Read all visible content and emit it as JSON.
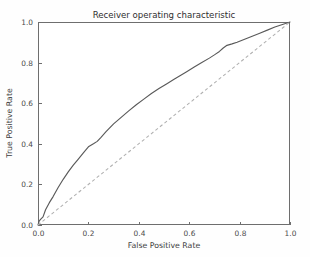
{
  "chart_data": {
    "type": "line",
    "title": "Receiver operating characteristic",
    "xlabel": "False Positive Rate",
    "ylabel": "True Positive Rate",
    "xlim": [
      0.0,
      1.0
    ],
    "ylim": [
      0.0,
      1.0
    ],
    "grid": false,
    "legend": "none",
    "xticks": [
      "0.0",
      "0.2",
      "0.4",
      "0.6",
      "0.8",
      "1.0"
    ],
    "xtick_values": [
      0.0,
      0.2,
      0.4,
      0.6,
      0.8,
      1.0
    ],
    "yticks": [
      "0.0",
      "0.2",
      "0.4",
      "0.6",
      "0.8",
      "1.0"
    ],
    "ytick_values": [
      0.0,
      0.2,
      0.4,
      0.6,
      0.8,
      1.0
    ],
    "series": [
      {
        "name": "ROC curve",
        "style": "solid",
        "color": "#5a5a5a",
        "x": [
          0.0,
          0.005,
          0.012,
          0.02,
          0.03,
          0.045,
          0.06,
          0.08,
          0.1,
          0.12,
          0.14,
          0.16,
          0.18,
          0.2,
          0.22,
          0.235,
          0.25,
          0.27,
          0.3,
          0.33,
          0.36,
          0.39,
          0.42,
          0.45,
          0.48,
          0.51,
          0.54,
          0.56,
          0.59,
          0.62,
          0.65,
          0.68,
          0.7,
          0.72,
          0.735,
          0.75,
          0.77,
          0.79,
          0.82,
          0.85,
          0.88,
          0.91,
          0.94,
          0.97,
          1.0
        ],
        "y": [
          0.0,
          0.02,
          0.03,
          0.04,
          0.075,
          0.11,
          0.14,
          0.185,
          0.225,
          0.262,
          0.295,
          0.325,
          0.355,
          0.385,
          0.4,
          0.412,
          0.432,
          0.46,
          0.498,
          0.53,
          0.562,
          0.592,
          0.62,
          0.648,
          0.672,
          0.695,
          0.718,
          0.733,
          0.755,
          0.778,
          0.8,
          0.822,
          0.838,
          0.855,
          0.872,
          0.885,
          0.892,
          0.9,
          0.915,
          0.93,
          0.945,
          0.96,
          0.975,
          0.988,
          1.0
        ]
      },
      {
        "name": "Chance level",
        "style": "dashed",
        "color": "#b0b0b0",
        "x": [
          0.0,
          1.0
        ],
        "y": [
          0.0,
          1.0
        ]
      }
    ]
  },
  "axes": {
    "title": "Receiver operating characteristic",
    "xlabel": "False Positive Rate",
    "ylabel": "True Positive Rate"
  }
}
